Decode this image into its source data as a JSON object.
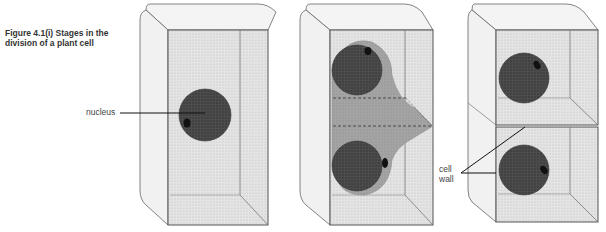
{
  "figure": {
    "caption_line1": "Figure 4.1(i)  Stages in the",
    "caption_line2": "division of a plant cell"
  },
  "labels": {
    "nucleus": "nucleus",
    "cell_wall_line1": "cell",
    "cell_wall_line2": "wall"
  },
  "stages": [
    {
      "name": "single-cell-with-nucleus",
      "nuclei": 1
    },
    {
      "name": "dividing-cell-with-spindle",
      "nuclei": 2
    },
    {
      "name": "two-daughter-cells-with-cell-wall",
      "nuclei": 2
    }
  ],
  "colors": {
    "outline": "#555555",
    "outer_face": "#f2f2f2",
    "inner_face": "#dcdcdc",
    "nucleus": "#4a4a4a",
    "nucleolus": "#111111",
    "spindle": "#9a9a9a"
  }
}
